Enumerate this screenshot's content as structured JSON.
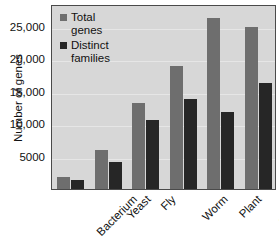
{
  "chart_data": {
    "type": "bar",
    "title": "",
    "xlabel": "",
    "ylabel": "Number of genes",
    "ylim": [
      0,
      28500
    ],
    "grid": true,
    "legend_position": "top-left",
    "categories": [
      "Bacterium",
      "Yeast",
      "Fly",
      "Worm",
      "Plant",
      "Human"
    ],
    "yticks": [
      5000,
      10000,
      15000,
      20000,
      25000
    ],
    "ytick_labels": [
      "5000",
      "10,000",
      "15,000",
      "20,000",
      "25,000"
    ],
    "series": [
      {
        "name": "Total genes",
        "color": "#6e6e6e",
        "values": [
          1800,
          6000,
          13300,
          19000,
          26400,
          25000
        ]
      },
      {
        "name": "Distinct families",
        "color": "#262626",
        "values": [
          1400,
          4200,
          10600,
          13800,
          11800,
          16300
        ]
      }
    ]
  },
  "legend": {
    "entries": [
      {
        "label": "Total\ngenes",
        "swatch": "total"
      },
      {
        "label": "Distinct\nfamilies",
        "swatch": "distinct"
      }
    ]
  },
  "colors": {
    "total_genes": "#6e6e6e",
    "distinct_families": "#262626",
    "plot_background": "#d7d7d7",
    "gridline": "#e6e6e6",
    "axis_border": "#4a4a4a"
  }
}
